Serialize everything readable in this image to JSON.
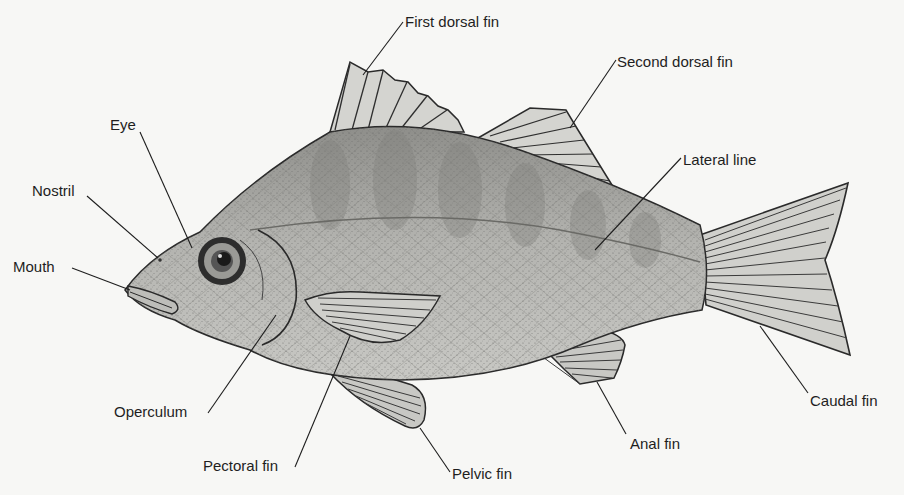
{
  "diagram": {
    "style": "stippled grayscale illustration",
    "colors": {
      "background": "#f7f7f5",
      "ink": "#1e1e1e",
      "body_fill": "#b9b9b5",
      "fin_fill": "#d4d4d0",
      "band_fill": "#8f8f8b"
    },
    "labels": [
      {
        "id": "first-dorsal-fin",
        "text": "First dorsal fin"
      },
      {
        "id": "second-dorsal-fin",
        "text": "Second dorsal fin"
      },
      {
        "id": "lateral-line",
        "text": "Lateral line"
      },
      {
        "id": "eye",
        "text": "Eye"
      },
      {
        "id": "nostril",
        "text": "Nostril"
      },
      {
        "id": "mouth",
        "text": "Mouth"
      },
      {
        "id": "operculum",
        "text": "Operculum"
      },
      {
        "id": "pectoral-fin",
        "text": "Pectoral fin"
      },
      {
        "id": "pelvic-fin",
        "text": "Pelvic fin"
      },
      {
        "id": "anal-fin",
        "text": "Anal fin"
      },
      {
        "id": "caudal-fin",
        "text": "Caudal fin"
      }
    ]
  }
}
